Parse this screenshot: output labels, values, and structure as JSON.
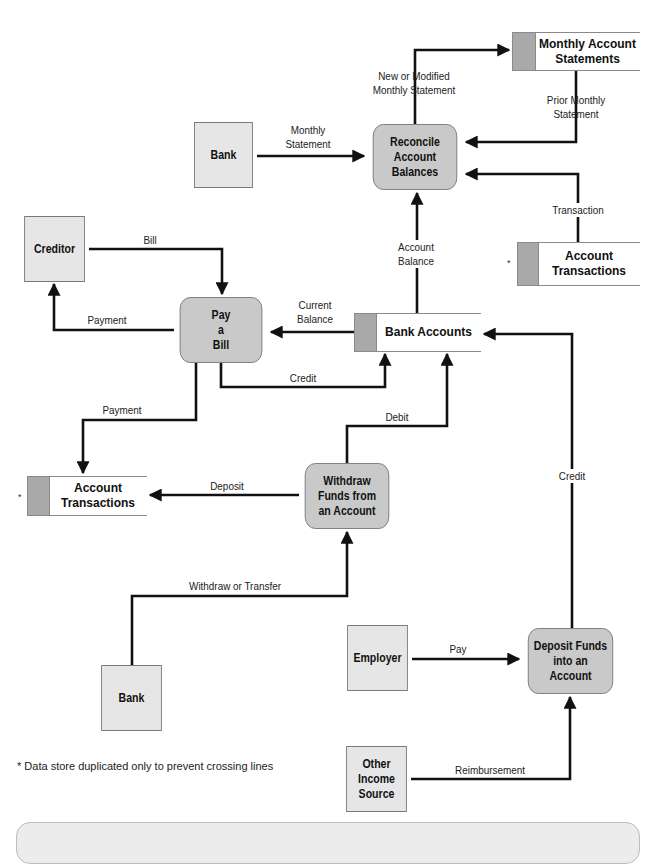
{
  "diagram": {
    "type": "data-flow-diagram",
    "processes": [
      {
        "id": "reconcile",
        "label": "Reconcile\nAccount\nBalances"
      },
      {
        "id": "pay_bill",
        "label": "Pay\na\nBill"
      },
      {
        "id": "withdraw",
        "label": "Withdraw\nFunds from\nan Account"
      },
      {
        "id": "deposit",
        "label": "Deposit Funds\ninto an\nAccount"
      }
    ],
    "entities": [
      {
        "id": "bank_top",
        "label": "Bank"
      },
      {
        "id": "creditor",
        "label": "Creditor"
      },
      {
        "id": "bank_bottom",
        "label": "Bank"
      },
      {
        "id": "employer",
        "label": "Employer"
      },
      {
        "id": "other_income",
        "label": "Other\nIncome\nSource"
      }
    ],
    "data_stores": [
      {
        "id": "monthly_statements",
        "label": "Monthly Account\nStatements",
        "marker": ""
      },
      {
        "id": "account_transactions_right",
        "label": "Account\nTransactions",
        "marker": "*"
      },
      {
        "id": "bank_accounts",
        "label": "Bank Accounts",
        "marker": ""
      },
      {
        "id": "account_transactions_left",
        "label": "Account\nTransactions",
        "marker": "*"
      }
    ],
    "flows": [
      {
        "id": "new_modified",
        "label": "New or Modified\nMonthly Statement",
        "from": "reconcile",
        "to": "monthly_statements"
      },
      {
        "id": "prior_monthly",
        "label": "Prior Monthly\nStatement",
        "from": "monthly_statements",
        "to": "reconcile"
      },
      {
        "id": "monthly_statement",
        "label": "Monthly\nStatement",
        "from": "bank_top",
        "to": "reconcile"
      },
      {
        "id": "transaction",
        "label": "Transaction",
        "from": "account_transactions_right",
        "to": "reconcile"
      },
      {
        "id": "account_balance",
        "label": "Account\nBalance",
        "from": "bank_accounts",
        "to": "reconcile"
      },
      {
        "id": "bill",
        "label": "Bill",
        "from": "creditor",
        "to": "pay_bill"
      },
      {
        "id": "payment_creditor",
        "label": "Payment",
        "from": "pay_bill",
        "to": "creditor"
      },
      {
        "id": "current_balance",
        "label": "Current\nBalance",
        "from": "bank_accounts",
        "to": "pay_bill"
      },
      {
        "id": "credit_paybill",
        "label": "Credit",
        "from": "pay_bill",
        "to": "bank_accounts"
      },
      {
        "id": "payment_trans",
        "label": "Payment",
        "from": "pay_bill",
        "to": "account_transactions_left"
      },
      {
        "id": "debit",
        "label": "Debit",
        "from": "withdraw",
        "to": "bank_accounts"
      },
      {
        "id": "deposit_flow",
        "label": "Deposit",
        "from": "withdraw",
        "to": "account_transactions_left"
      },
      {
        "id": "credit_deposit",
        "label": "Credit",
        "from": "deposit",
        "to": "bank_accounts"
      },
      {
        "id": "withdraw_transfer",
        "label": "Withdraw or Transfer",
        "from": "bank_bottom",
        "to": "withdraw"
      },
      {
        "id": "pay",
        "label": "Pay",
        "from": "employer",
        "to": "deposit"
      },
      {
        "id": "reimbursement",
        "label": "Reimbursement",
        "from": "other_income",
        "to": "deposit"
      }
    ],
    "footnote": "* Data store duplicated only to prevent crossing lines"
  },
  "colors": {
    "process_fill": "#c9c9c9",
    "entity_fill": "#e6e6e6",
    "store_tab": "#a9a9a9",
    "line": "#111111",
    "panel_fill": "#ececec"
  }
}
